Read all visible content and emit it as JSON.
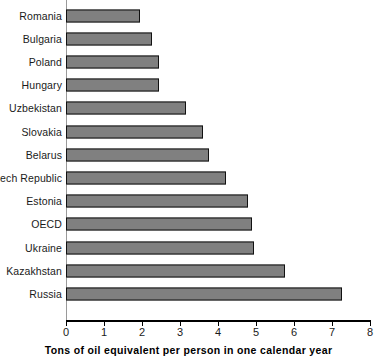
{
  "chart_data": {
    "type": "bar",
    "orientation": "horizontal",
    "title": "",
    "xlabel": "Tons of oil equivalent per person in one calendar year",
    "ylabel": "",
    "xlim": [
      0,
      8
    ],
    "xticks": [
      "0",
      "1",
      "2",
      "3",
      "4",
      "5",
      "6",
      "7",
      "8"
    ],
    "grid": false,
    "legend": false,
    "categories": [
      "Romania",
      "Bulgaria",
      "Poland",
      "Hungary",
      "Uzbekistan",
      "Slovakia",
      "Belarus",
      "Czech Republic",
      "Estonia",
      "OECD",
      "Ukraine",
      "Kazakhstan",
      "Russia"
    ],
    "values": [
      1.95,
      2.25,
      2.45,
      2.45,
      3.15,
      3.6,
      3.75,
      4.2,
      4.8,
      4.9,
      4.95,
      5.75,
      7.25
    ],
    "bars": [
      {
        "label": "Romania",
        "value": 1.95
      },
      {
        "label": "Bulgaria",
        "value": 2.25
      },
      {
        "label": "Poland",
        "value": 2.45
      },
      {
        "label": "Hungary",
        "value": 2.45
      },
      {
        "label": "Uzbekistan",
        "value": 3.15
      },
      {
        "label": "Slovakia",
        "value": 3.6
      },
      {
        "label": "Belarus",
        "value": 3.75
      },
      {
        "label": "Czech Republic",
        "value": 4.2
      },
      {
        "label": "Estonia",
        "value": 4.8
      },
      {
        "label": "OECD",
        "value": 4.9
      },
      {
        "label": "Ukraine",
        "value": 4.95
      },
      {
        "label": "Kazakhstan",
        "value": 5.75
      },
      {
        "label": "Russia",
        "value": 7.25
      }
    ],
    "colors": {
      "bar_fill": "#808080",
      "bar_border": "#111111",
      "axis": "#000000",
      "text": "#1a1a1a",
      "background": "#ffffff"
    }
  }
}
